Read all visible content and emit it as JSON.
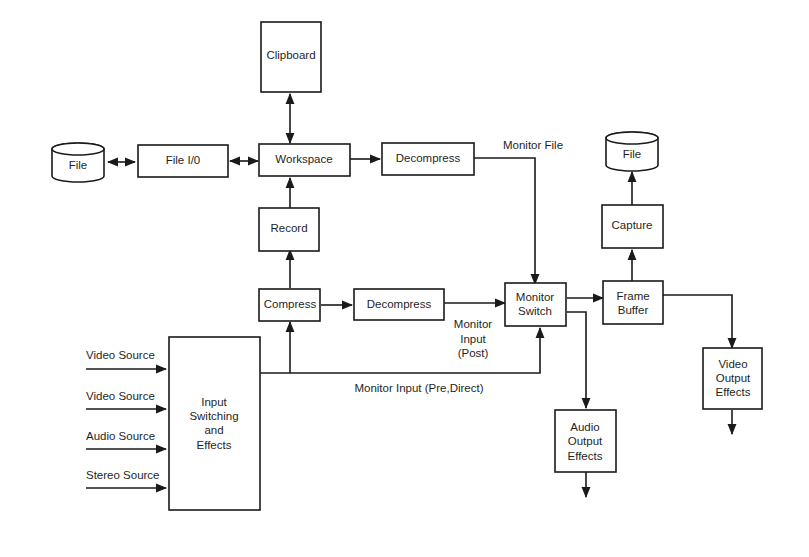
{
  "diagram": {
    "type": "block-diagram",
    "nodes": {
      "clipboard": {
        "label": "Clipboard"
      },
      "file_left": {
        "label": "File",
        "shape": "cylinder"
      },
      "file_io": {
        "label": "File I/0"
      },
      "workspace": {
        "label": "Workspace"
      },
      "decompress_top": {
        "label": "Decompress"
      },
      "file_right": {
        "label": "File",
        "shape": "cylinder"
      },
      "capture": {
        "label": "Capture"
      },
      "record": {
        "label": "Record"
      },
      "compress": {
        "label": "Compress"
      },
      "decompress_mid": {
        "label": "Decompress"
      },
      "monitor_switch": {
        "lines": [
          "Monitor",
          "Switch"
        ]
      },
      "frame_buffer": {
        "lines": [
          "Frame",
          "Buffer"
        ]
      },
      "input_switching": {
        "lines": [
          "Input",
          "Switching",
          "and",
          "Effects"
        ]
      },
      "video_output_effects": {
        "lines": [
          "Video",
          "Output",
          "Effects"
        ]
      },
      "audio_output_effects": {
        "lines": [
          "Audio",
          "Output",
          "Effects"
        ]
      }
    },
    "sources": [
      {
        "label": "Video Source"
      },
      {
        "label": "Video Source"
      },
      {
        "label": "Audio Source"
      },
      {
        "label": "Stereo Source"
      }
    ],
    "edge_labels": {
      "monitor_file": "Monitor File",
      "monitor_input_post": [
        "Monitor",
        "Input",
        "(Post)"
      ],
      "monitor_input_pre_direct": "Monitor Input (Pre,Direct)"
    },
    "edges": [
      {
        "from": "file_left",
        "to": "file_io",
        "bidirectional": true
      },
      {
        "from": "file_io",
        "to": "workspace",
        "bidirectional": true
      },
      {
        "from": "workspace",
        "to": "clipboard",
        "bidirectional": true
      },
      {
        "from": "workspace",
        "to": "decompress_top"
      },
      {
        "from": "decompress_top",
        "to": "monitor_switch",
        "label": "Monitor File"
      },
      {
        "from": "record",
        "to": "workspace"
      },
      {
        "from": "compress",
        "to": "record"
      },
      {
        "from": "compress",
        "to": "decompress_mid"
      },
      {
        "from": "decompress_mid",
        "to": "monitor_switch",
        "label": "Monitor Input (Post)"
      },
      {
        "from": "input_switching",
        "to": "compress"
      },
      {
        "from": "input_switching",
        "to": "monitor_switch",
        "label": "Monitor Input (Pre,Direct)"
      },
      {
        "from": "monitor_switch",
        "to": "frame_buffer"
      },
      {
        "from": "monitor_switch",
        "to": "audio_output_effects"
      },
      {
        "from": "frame_buffer",
        "to": "capture"
      },
      {
        "from": "capture",
        "to": "file_right"
      },
      {
        "from": "frame_buffer",
        "to": "video_output_effects"
      }
    ]
  }
}
